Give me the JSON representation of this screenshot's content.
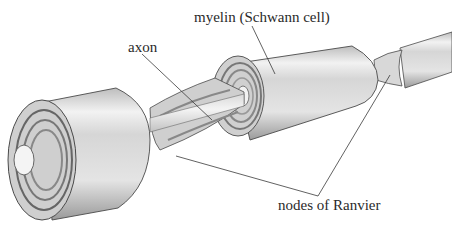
{
  "diagram": {
    "labels": {
      "myelin": "myelin (Schwann cell)",
      "axon": "axon",
      "nodes": "nodes of Ranvier"
    },
    "colors": {
      "sheath_light": "#e6e6e6",
      "sheath_mid": "#c8c8c8",
      "sheath_dark": "#8c8c8c",
      "outline": "#4a4a4a",
      "leader_line": "#3a3a3a",
      "text": "#2a2a2a"
    }
  }
}
